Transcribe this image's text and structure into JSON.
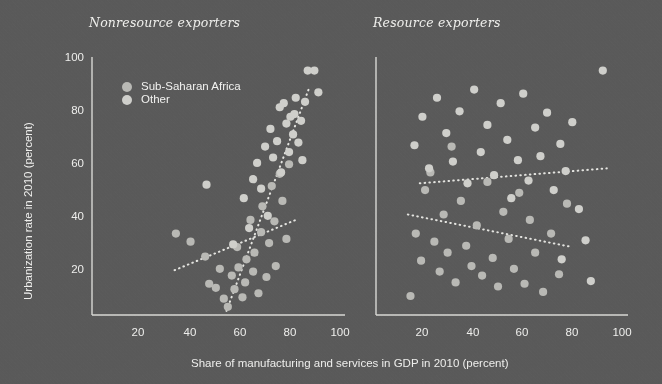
{
  "figure": {
    "background_color": "#5a5a5a",
    "axis_color": "#d8d8d4",
    "text_color": "#eeeeec",
    "x_axis_label": "Share of manufacturing and services in GDP in 2010 (percent)",
    "y_axis_label": "Urbanization rate in 2010 (percent)"
  },
  "legend": {
    "items": [
      {
        "label": "Sub-Saharan Africa",
        "color": "#b9b9b5"
      },
      {
        "label": "Other",
        "color": "#cfcfcb"
      }
    ]
  },
  "chart_data": [
    {
      "type": "scatter",
      "title": "Nonresource exporters",
      "xlabel": "Share of manufacturing and services in GDP in 2010 (percent)",
      "ylabel": "Urbanization rate in 2010 (percent)",
      "xlim": [
        10,
        105
      ],
      "ylim": [
        10,
        105
      ],
      "xticks": [
        20,
        40,
        60,
        80,
        100
      ],
      "yticks": [
        20,
        40,
        60,
        80,
        100
      ],
      "grid": false,
      "legend_position": "upper-left",
      "series": [
        {
          "name": "Sub-Saharan Africa",
          "color": "#b9b9b5",
          "points": [
            [
              41.5,
              40.0
            ],
            [
              47.0,
              37.0
            ],
            [
              52.5,
              31.5
            ],
            [
              54.0,
              21.5
            ],
            [
              56.5,
              20.0
            ],
            [
              58.0,
              27.0
            ],
            [
              59.5,
              16.0
            ],
            [
              61.0,
              13.0
            ],
            [
              62.5,
              24.5
            ],
            [
              63.5,
              19.5
            ],
            [
              64.5,
              35.0
            ],
            [
              65.0,
              27.5
            ],
            [
              66.5,
              16.5
            ],
            [
              67.5,
              22.0
            ],
            [
              68.0,
              30.5
            ],
            [
              69.5,
              45.0
            ],
            [
              70.5,
              26.0
            ],
            [
              71.0,
              33.0
            ],
            [
              72.5,
              18.0
            ],
            [
              73.5,
              40.5
            ],
            [
              74.0,
              50.0
            ],
            [
              75.5,
              24.0
            ],
            [
              76.5,
              36.5
            ],
            [
              77.5,
              57.5
            ],
            [
              78.5,
              44.5
            ],
            [
              79.0,
              28.0
            ],
            [
              80.5,
              62.0
            ],
            [
              81.5,
              52.0
            ],
            [
              83.0,
              38.0
            ],
            [
              84.0,
              65.5
            ]
          ]
        },
        {
          "name": "Other",
          "color": "#cfcfcb",
          "points": [
            [
              53.0,
              58.0
            ],
            [
              63.0,
              36.0
            ],
            [
              67.0,
              53.0
            ],
            [
              69.0,
              42.0
            ],
            [
              70.5,
              60.0
            ],
            [
              72.0,
              66.0
            ],
            [
              73.5,
              56.5
            ],
            [
              75.0,
              72.0
            ],
            [
              76.0,
              46.5
            ],
            [
              77.0,
              78.5
            ],
            [
              78.0,
              68.0
            ],
            [
              79.5,
              74.0
            ],
            [
              80.5,
              86.5
            ],
            [
              81.0,
              62.5
            ],
            [
              82.0,
              88.0
            ],
            [
              83.0,
              80.5
            ],
            [
              84.0,
              70.0
            ],
            [
              84.5,
              83.0
            ],
            [
              85.5,
              76.5
            ],
            [
              86.0,
              84.0
            ],
            [
              86.5,
              90.0
            ],
            [
              87.5,
              73.5
            ],
            [
              88.5,
              81.5
            ],
            [
              89.0,
              67.0
            ],
            [
              90.0,
              88.5
            ],
            [
              91.0,
              100.0
            ],
            [
              93.5,
              100.0
            ],
            [
              95.0,
              92.0
            ]
          ]
        }
      ],
      "trend_lines": [
        {
          "name": "Sub-Saharan Africa trend",
          "style": "dotted",
          "x_start": 41.0,
          "y_start": 26.5,
          "x_end": 86.5,
          "y_end": 45.0
        },
        {
          "name": "Other trend",
          "style": "dotted",
          "x_start": 60.5,
          "y_start": 11.5,
          "x_end": 91.5,
          "y_end": 93.5
        }
      ]
    },
    {
      "type": "scatter",
      "title": "Resource exporters",
      "xlabel": "Share of manufacturing and services in GDP in 2010 (percent)",
      "ylabel": "Urbanization rate in 2010 (percent)",
      "xlim": [
        10,
        105
      ],
      "ylim": [
        10,
        105
      ],
      "xticks": [
        20,
        40,
        60,
        80,
        100
      ],
      "yticks": [
        20,
        40,
        60,
        80,
        100
      ],
      "grid": false,
      "legend_position": "none",
      "series": [
        {
          "name": "Sub-Saharan Africa",
          "color": "#b9b9b5",
          "points": [
            [
              23.0,
              17.0
            ],
            [
              25.0,
              40.0
            ],
            [
              27.0,
              30.0
            ],
            [
              28.5,
              56.0
            ],
            [
              30.5,
              62.5
            ],
            [
              32.0,
              37.0
            ],
            [
              34.0,
              26.0
            ],
            [
              35.5,
              47.0
            ],
            [
              37.0,
              33.0
            ],
            [
              38.5,
              72.0
            ],
            [
              40.0,
              22.0
            ],
            [
              42.0,
              52.0
            ],
            [
              44.0,
              35.5
            ],
            [
              46.0,
              28.0
            ],
            [
              48.0,
              43.0
            ],
            [
              50.0,
              24.5
            ],
            [
              52.0,
              59.0
            ],
            [
              54.0,
              31.0
            ],
            [
              56.0,
              20.5
            ],
            [
              58.0,
              48.0
            ],
            [
              60.0,
              38.0
            ],
            [
              62.0,
              27.0
            ],
            [
              64.0,
              55.0
            ],
            [
              66.0,
              21.5
            ],
            [
              68.0,
              45.0
            ],
            [
              70.0,
              33.0
            ],
            [
              73.0,
              18.5
            ],
            [
              76.0,
              40.0
            ],
            [
              79.0,
              25.0
            ],
            [
              82.0,
              51.0
            ]
          ]
        },
        {
          "name": "Other",
          "color": "#cfcfcb",
          "points": [
            [
              24.5,
              72.5
            ],
            [
              27.5,
              83.0
            ],
            [
              30.0,
              64.0
            ],
            [
              33.0,
              90.0
            ],
            [
              36.5,
              77.0
            ],
            [
              39.0,
              66.5
            ],
            [
              41.5,
              85.0
            ],
            [
              44.5,
              58.5
            ],
            [
              47.0,
              93.0
            ],
            [
              49.5,
              70.0
            ],
            [
              52.0,
              80.0
            ],
            [
              54.5,
              61.5
            ],
            [
              57.0,
              88.0
            ],
            [
              59.5,
              74.5
            ],
            [
              61.0,
              53.0
            ],
            [
              63.5,
              67.0
            ],
            [
              65.5,
              91.5
            ],
            [
              67.5,
              59.5
            ],
            [
              70.0,
              79.0
            ],
            [
              72.0,
              68.5
            ],
            [
              74.5,
              84.5
            ],
            [
              77.0,
              56.0
            ],
            [
              79.5,
              73.0
            ],
            [
              81.5,
              63.0
            ],
            [
              84.0,
              81.0
            ],
            [
              86.5,
              49.0
            ],
            [
              89.0,
              37.5
            ],
            [
              91.0,
              22.5
            ],
            [
              95.5,
              100.0
            ],
            [
              80.0,
              30.5
            ]
          ]
        }
      ],
      "trend_lines": [
        {
          "name": "Sub-Saharan Africa trend",
          "style": "dotted",
          "x_start": 22.0,
          "y_start": 47.0,
          "x_end": 84.0,
          "y_end": 35.0
        },
        {
          "name": "Other trend",
          "style": "dotted",
          "x_start": 26.5,
          "y_start": 58.5,
          "x_end": 97.0,
          "y_end": 64.0
        }
      ]
    }
  ]
}
